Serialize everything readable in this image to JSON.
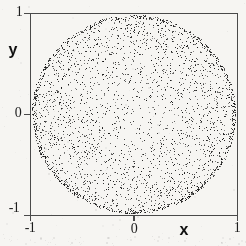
{
  "figure": {
    "x_axis": {
      "label": "x",
      "tick_labels": [
        "-1",
        "0",
        "1"
      ],
      "range": [
        -1,
        1
      ]
    },
    "y_axis": {
      "label": "y",
      "tick_labels": [
        "1",
        "0",
        "-1"
      ],
      "range": [
        -1,
        1
      ]
    }
  },
  "chart_data": {
    "type": "scatter",
    "title": "",
    "xlabel": "x",
    "ylabel": "y",
    "xlim": [
      -1,
      1
    ],
    "ylim": [
      -1,
      1
    ],
    "x_ticks": [
      -1,
      0,
      1
    ],
    "y_ticks": [
      -1,
      0,
      1
    ],
    "grid": false,
    "legend": null,
    "points_spec": {
      "n_body": 2400,
      "body_radius_exponent": 0.4,
      "n_rim": 650,
      "rim_radius_range": [
        0.965,
        1.0
      ],
      "disk_radius": 1.0,
      "seed": 20240613
    },
    "point_color": "#141414",
    "background_noise": {
      "n_scatter": 130,
      "n_bottom_band": 60,
      "color": "#8a8a8a"
    }
  },
  "style": {
    "frame_color": "#4a4a4a",
    "paper_color": "#f6f5f2"
  }
}
